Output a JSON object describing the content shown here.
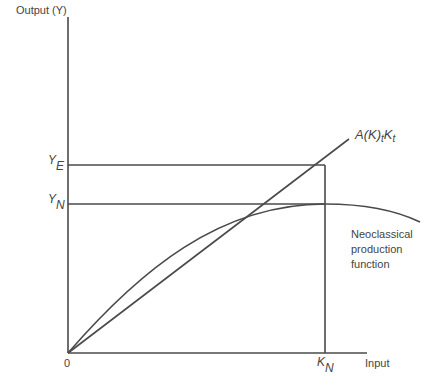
{
  "diagram": {
    "y_axis_label": "Output (Y)",
    "x_axis_label": "Input",
    "origin_label": "0",
    "y_ticks": [
      {
        "main": "Y",
        "sub": "E"
      },
      {
        "main": "Y",
        "sub": "N"
      }
    ],
    "x_ticks": [
      {
        "main": "K",
        "sub": "N"
      }
    ],
    "line_label": {
      "a": "A(K)",
      "t1": "t",
      "k": "K",
      "t2": "t"
    },
    "curve_label": [
      "Neoclassical",
      "production",
      "function"
    ],
    "line_color": "#444444"
  }
}
